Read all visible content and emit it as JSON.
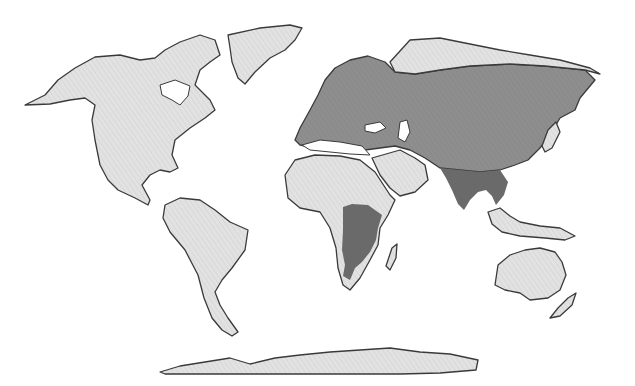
{
  "map": {
    "type": "world-distribution-map",
    "colors": {
      "background": "#ffffff",
      "land_base": "#e2e2e2",
      "range_medium": "#8e8e8e",
      "range_dark": "#6a6a6a",
      "coastline": "#3a3a3a"
    },
    "regions": [
      {
        "name": "North America",
        "shade": "land_base"
      },
      {
        "name": "Greenland",
        "shade": "land_base"
      },
      {
        "name": "South America",
        "shade": "land_base"
      },
      {
        "name": "Africa (north & west)",
        "shade": "land_base"
      },
      {
        "name": "Arabian Peninsula",
        "shade": "land_base"
      },
      {
        "name": "Northern Siberia",
        "shade": "land_base"
      },
      {
        "name": "Southeast Asia & Indonesia",
        "shade": "land_base"
      },
      {
        "name": "Australia",
        "shade": "land_base"
      },
      {
        "name": "New Zealand",
        "shade": "land_base"
      },
      {
        "name": "Antarctica",
        "shade": "land_base"
      },
      {
        "name": "Europe & Central/East Asia",
        "shade": "range_medium"
      },
      {
        "name": "Indian Subcontinent & Indochina",
        "shade": "range_dark"
      },
      {
        "name": "Southern & Eastern Africa",
        "shade": "range_dark"
      }
    ]
  }
}
